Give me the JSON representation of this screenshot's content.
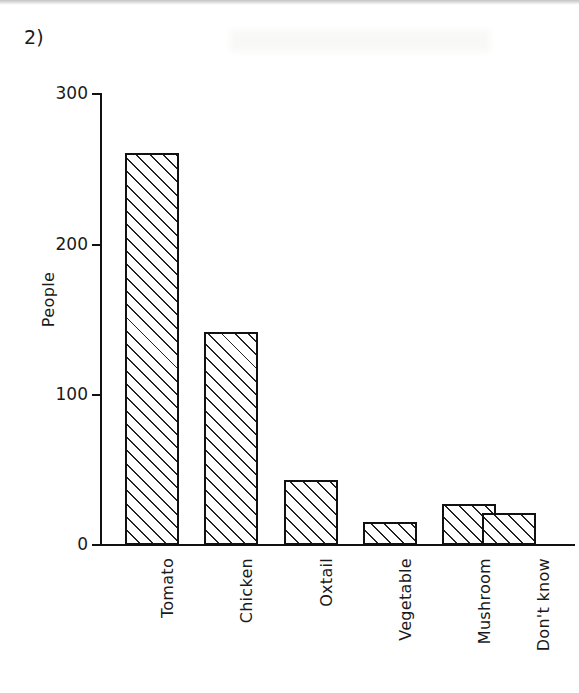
{
  "figure": {
    "number_label": "2)"
  },
  "chart_data": {
    "type": "bar",
    "title": "",
    "subtitle": "",
    "xlabel": "",
    "ylabel": "People",
    "categories": [
      "Tomato",
      "Chicken",
      "Oxtail",
      "Vegetable",
      "Mushroom",
      "Don't know"
    ],
    "values": [
      261,
      142,
      43,
      15,
      27,
      21
    ],
    "series": [
      {
        "name": "People",
        "values": [
          261,
          142,
          43,
          15,
          27,
          21
        ]
      }
    ],
    "ylim": [
      0,
      300
    ],
    "yticks": [
      0,
      100,
      200,
      300
    ],
    "ytick_labels": [
      "0",
      "100",
      "200",
      "300"
    ],
    "grid": false,
    "legend": null,
    "legend_position": "none",
    "bar_fill": "diagonal-hatch",
    "bar_edge_color": "#111111",
    "bar_fill_color": "#ffffff",
    "background_color": "#ffffff",
    "annotations": [
      "2)"
    ]
  }
}
